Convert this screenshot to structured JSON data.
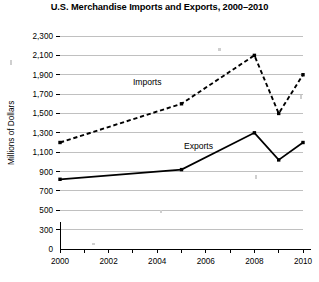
{
  "chart_data": {
    "type": "line",
    "title": "U.S. Merchandise Imports and Exports, 2000–2010",
    "xlabel": "",
    "ylabel": "Millions of Dollars",
    "grid": true,
    "legend_position": "inline-labels",
    "xlim": [
      2000,
      2010
    ],
    "ylim": [
      0,
      2300
    ],
    "x_tick_labels": [
      "2000",
      "2002",
      "2004",
      "2006",
      "2008",
      "2010"
    ],
    "x_tick_values": [
      2000,
      2002,
      2004,
      2006,
      2008,
      2010
    ],
    "x_minor_tick_values": [
      2001,
      2003,
      2005,
      2007,
      2009
    ],
    "y_tick_labels": [
      "0",
      "300",
      "500",
      "700",
      "900",
      "1,100",
      "1,300",
      "1,500",
      "1,700",
      "1,900",
      "2,100",
      "2,300"
    ],
    "y_tick_values": [
      0,
      300,
      500,
      700,
      900,
      1100,
      1300,
      1500,
      1700,
      1900,
      2100,
      2300
    ],
    "series": [
      {
        "name": "Imports",
        "style": "dashed",
        "label": "Imports",
        "label_x": 2003.0,
        "label_y": 1790,
        "x": [
          2000,
          2005,
          2008,
          2009,
          2010
        ],
        "values": [
          1200,
          1600,
          2100,
          1500,
          1900
        ]
      },
      {
        "name": "Exports",
        "style": "solid",
        "label": "Exports",
        "label_x": 2005.1,
        "label_y": 1130,
        "x": [
          2000,
          2005,
          2008,
          2009,
          2010
        ],
        "values": [
          820,
          920,
          1300,
          1020,
          1200
        ]
      }
    ]
  },
  "figure": {
    "plot_left": 60,
    "plot_right": 303,
    "plot_top": 36,
    "plot_bottom": 249,
    "zero_row_y": 249,
    "baseline_value_y": 258
  }
}
